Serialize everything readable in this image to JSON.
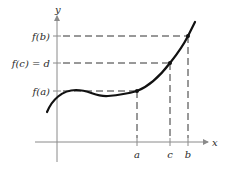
{
  "diagram": {
    "type": "function-graph",
    "axes": {
      "x_label": "x",
      "y_label": "y"
    },
    "x_ticks": [
      {
        "name": "a",
        "label": "a"
      },
      {
        "name": "c",
        "label": "c"
      },
      {
        "name": "b",
        "label": "b"
      }
    ],
    "y_ticks": [
      {
        "name": "f-b",
        "label": "f(b)"
      },
      {
        "name": "f-c",
        "label": "f(c) = d"
      },
      {
        "name": "f-a",
        "label": "f(a)"
      }
    ],
    "points": [
      "(a, f(a))",
      "(c, f(c))",
      "(b, f(b))"
    ],
    "colors": {
      "curve": "#111111",
      "axis": "#8a8a8a",
      "dash": "#333333",
      "text": "#2a2a2a"
    }
  }
}
